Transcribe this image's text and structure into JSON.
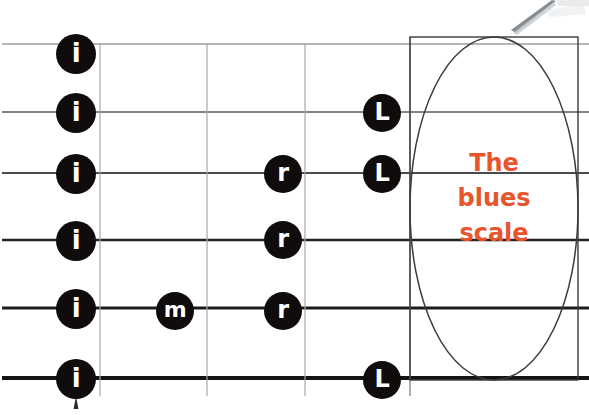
{
  "diagram": {
    "kind": "guitar-fretboard-fingering-chart",
    "title_callout": {
      "lines": [
        "The",
        "blues",
        "scale"
      ],
      "text": "The blues scale",
      "color": "#e8552d"
    },
    "colors": {
      "background": "#ffffff",
      "string": "#1a1a1a",
      "fret": "#9a9a9a",
      "marker_fill": "#100c0b",
      "marker_text": "#ffffff",
      "callout_outline": "#3b3b3b",
      "accent": "#e8552d"
    },
    "strings": [
      {
        "index": 1,
        "name": "string-1",
        "y": 44,
        "thickness": 1.1
      },
      {
        "index": 2,
        "name": "string-2",
        "y": 112,
        "thickness": 1.4
      },
      {
        "index": 3,
        "name": "string-3",
        "y": 173,
        "thickness": 1.7
      },
      {
        "index": 4,
        "name": "string-4",
        "y": 240,
        "thickness": 2.6
      },
      {
        "index": 5,
        "name": "string-5",
        "y": 308,
        "thickness": 3.1
      },
      {
        "index": 6,
        "name": "string-6",
        "y": 378,
        "thickness": 4.0
      }
    ],
    "frets": [
      {
        "index": 1,
        "x": 100
      },
      {
        "index": 2,
        "x": 207
      },
      {
        "index": 3,
        "x": 305
      },
      {
        "index": 4,
        "x": 410
      }
    ],
    "markers": [
      {
        "id": "m1",
        "label": "i",
        "finger": "index",
        "string": 1,
        "fret": 0,
        "x": 76,
        "y": 54,
        "size": 40
      },
      {
        "id": "m2",
        "label": "i",
        "finger": "index",
        "string": 2,
        "fret": 0,
        "x": 76,
        "y": 113,
        "size": 40
      },
      {
        "id": "m3",
        "label": "i",
        "finger": "index",
        "string": 3,
        "fret": 0,
        "x": 76,
        "y": 174,
        "size": 40
      },
      {
        "id": "m4",
        "label": "i",
        "finger": "index",
        "string": 4,
        "fret": 0,
        "x": 76,
        "y": 241,
        "size": 40
      },
      {
        "id": "m5",
        "label": "i",
        "finger": "index",
        "string": 5,
        "fret": 0,
        "x": 76,
        "y": 309,
        "size": 40
      },
      {
        "id": "m6",
        "label": "i",
        "finger": "index",
        "string": 6,
        "fret": 0,
        "x": 76,
        "y": 379,
        "size": 40
      },
      {
        "id": "m7",
        "label": "m",
        "finger": "middle",
        "string": 5,
        "fret": 2,
        "x": 175,
        "y": 311,
        "size": 38
      },
      {
        "id": "m8",
        "label": "r",
        "finger": "ring",
        "string": 3,
        "fret": 3,
        "x": 283,
        "y": 174,
        "size": 38
      },
      {
        "id": "m9",
        "label": "r",
        "finger": "ring",
        "string": 4,
        "fret": 3,
        "x": 283,
        "y": 240,
        "size": 38
      },
      {
        "id": "m10",
        "label": "r",
        "finger": "ring",
        "string": 5,
        "fret": 3,
        "x": 283,
        "y": 311,
        "size": 38
      },
      {
        "id": "m11",
        "label": "L",
        "finger": "little",
        "string": 2,
        "fret": 4,
        "x": 382,
        "y": 113,
        "size": 38
      },
      {
        "id": "m12",
        "label": "L",
        "finger": "little",
        "string": 3,
        "fret": 4,
        "x": 382,
        "y": 174,
        "size": 38
      },
      {
        "id": "m13",
        "label": "L",
        "finger": "little",
        "string": 6,
        "fret": 4,
        "x": 382,
        "y": 380,
        "size": 38
      }
    ],
    "callout_box": {
      "x": 410,
      "y": 37,
      "width": 168,
      "height": 343
    },
    "stylus": {
      "name": "stylus-pen-tip",
      "present": true
    },
    "nut_pointer": {
      "name": "position-pointer-tick",
      "x": 76,
      "y": 398
    }
  }
}
